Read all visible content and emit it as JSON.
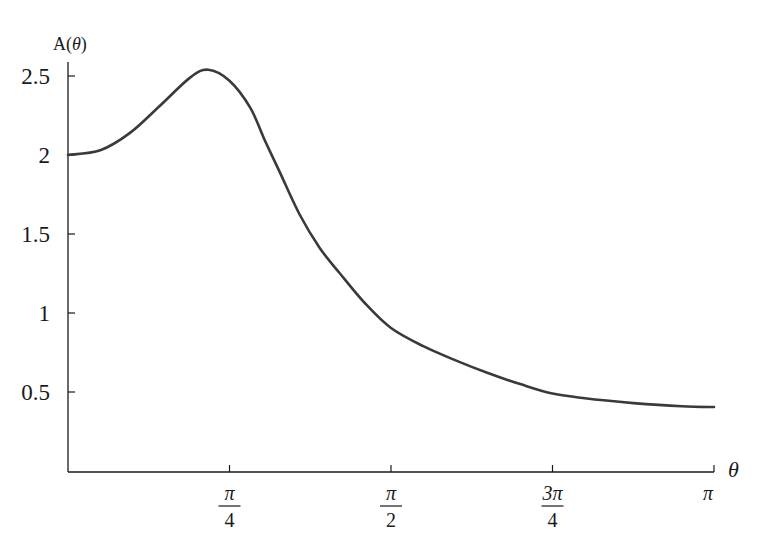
{
  "chart_data": {
    "type": "line",
    "title": "",
    "xlabel": "θ",
    "ylabel": "A(θ)",
    "xlim_over_pi": [
      0,
      1
    ],
    "ylim": [
      0,
      2.6
    ],
    "grid": false,
    "legend": null,
    "y_ticks": [
      {
        "value": 0.5,
        "label": "0.5"
      },
      {
        "value": 1,
        "label": "1"
      },
      {
        "value": 1.5,
        "label": "1.5"
      },
      {
        "value": 2,
        "label": "2"
      },
      {
        "value": 2.5,
        "label": "2.5"
      }
    ],
    "x_ticks": [
      {
        "value_over_pi": 0.25,
        "num": "π",
        "den": "4"
      },
      {
        "value_over_pi": 0.5,
        "num": "π",
        "den": "2"
      },
      {
        "value_over_pi": 0.75,
        "num": "3π",
        "den": "4"
      },
      {
        "value_over_pi": 1.0,
        "num": "π",
        "den": ""
      }
    ],
    "series": [
      {
        "name": "A(θ)",
        "color": "#3a3a3a",
        "x_over_pi": [
          0,
          0.05,
          0.096,
          0.142,
          0.189,
          0.217,
          0.25,
          0.282,
          0.305,
          0.328,
          0.359,
          0.39,
          0.421,
          0.46,
          0.5,
          0.55,
          0.6,
          0.65,
          0.7,
          0.75,
          0.8,
          0.875,
          0.95,
          1.0
        ],
        "y": [
          2.0,
          2.03,
          2.14,
          2.31,
          2.49,
          2.54,
          2.47,
          2.3,
          2.09,
          1.89,
          1.62,
          1.41,
          1.25,
          1.06,
          0.905,
          0.79,
          0.7,
          0.62,
          0.55,
          0.49,
          0.46,
          0.43,
          0.41,
          0.405
        ]
      }
    ]
  }
}
